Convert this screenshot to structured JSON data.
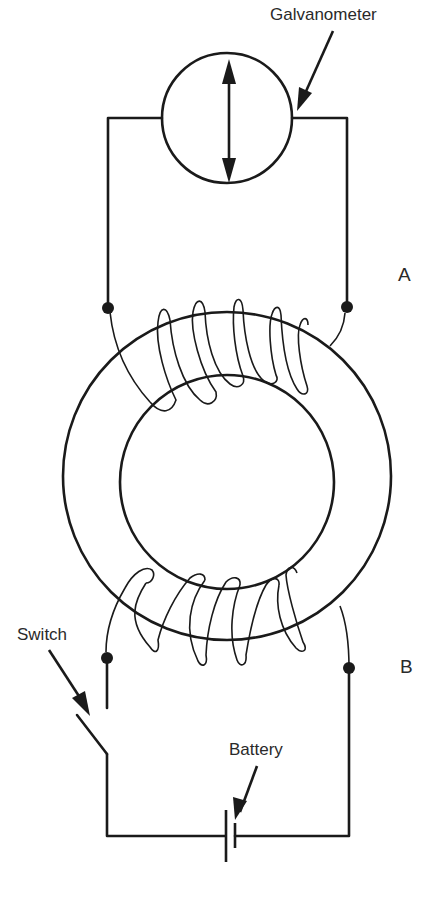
{
  "labels": {
    "galvanometer": "Galvanometer",
    "coil_a": "A",
    "coil_b": "B",
    "switch": "Switch",
    "battery": "Battery"
  },
  "components": {
    "galvanometer": {
      "type": "meter",
      "symbol": "double-headed-arrow"
    },
    "ring": {
      "type": "iron-ring",
      "outer_radius": 164,
      "inner_radius": 106
    },
    "coil_a": {
      "position": "top",
      "turns": 6,
      "connected_to": "galvanometer"
    },
    "coil_b": {
      "position": "bottom",
      "turns": 6,
      "connected_to": [
        "switch",
        "battery"
      ]
    },
    "switch": {
      "state": "open"
    },
    "battery": {
      "type": "cell"
    }
  },
  "colors": {
    "line": "#1a1a1a",
    "text": "#2a2a2a",
    "background": "#ffffff"
  }
}
